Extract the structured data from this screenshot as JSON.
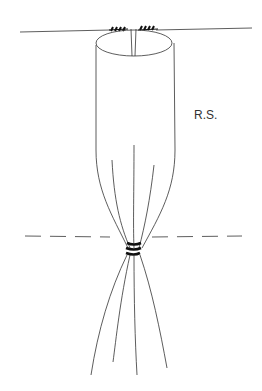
{
  "diagram": {
    "label": "R.S.",
    "colors": {
      "line": "#333333",
      "background": "#ffffff"
    }
  }
}
